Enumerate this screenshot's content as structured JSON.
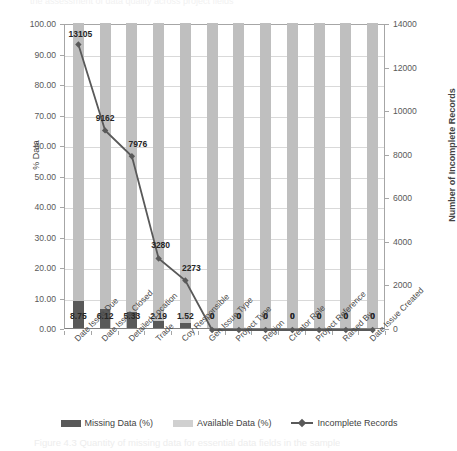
{
  "artifacts": {
    "top_partial_text": "the assessment of data quality across project fields",
    "bottom_caption_partial": "Figure 4.3  Quantity of missing data for essential data fields in the sample"
  },
  "chart_data": {
    "type": "bar",
    "title": "",
    "xlabel": "",
    "ylabel": "% Data",
    "y2label": "Number of Incomplete Records",
    "ylim": [
      0,
      100
    ],
    "y2lim": [
      0,
      14000
    ],
    "ytick_step": 10,
    "y2tick_step": 2000,
    "grid": true,
    "legend_position": "bottom",
    "categories": [
      "Date Issue Due",
      "Date Issue Closed",
      "Detailed Location",
      "Trade",
      "Coy Responsible",
      "Gen Issue Type",
      "Project Type",
      "Region",
      "Creator Role",
      "Project Reference",
      "Raised By",
      "Date Issue Created"
    ],
    "yticks": [
      "0.00",
      "10.00",
      "20.00",
      "30.00",
      "40.00",
      "50.00",
      "60.00",
      "70.00",
      "80.00",
      "90.00",
      "100.00"
    ],
    "y2ticks": [
      "0",
      "2000",
      "4000",
      "6000",
      "8000",
      "10000",
      "12000",
      "14000"
    ],
    "series": [
      {
        "name": "Missing Data (%)",
        "type": "bar",
        "axis": "left",
        "color": "#595959",
        "values": [
          8.75,
          6.12,
          5.33,
          2.19,
          1.52,
          0,
          0,
          0,
          0,
          0,
          0,
          0
        ],
        "labels": [
          "8.75",
          "6.12",
          "5.33",
          "2.19",
          "1.52",
          "0",
          "0",
          "0",
          "0",
          "0",
          "0",
          "0"
        ]
      },
      {
        "name": "Available Data (%)",
        "type": "bar",
        "axis": "left",
        "color": "#bfbfbf",
        "values": [
          100,
          100,
          100,
          100,
          100,
          100,
          100,
          100,
          100,
          100,
          100,
          100
        ],
        "labels": [
          "",
          "",
          "",
          "",
          "",
          "",
          "",
          "",
          "",
          "",
          "",
          ""
        ]
      },
      {
        "name": "Incomplete Records",
        "type": "line",
        "axis": "right",
        "color": "#595959",
        "values": [
          13105,
          9162,
          7976,
          3280,
          2273,
          0,
          0,
          0,
          0,
          0,
          0,
          0
        ],
        "labels": [
          "13105",
          "9162",
          "7976",
          "3280",
          "2273",
          "0",
          "0",
          "0",
          "0",
          "0",
          "0",
          "0"
        ]
      }
    ]
  },
  "legend": {
    "items": [
      {
        "label": "Missing Data (%)",
        "marker": "square-dark"
      },
      {
        "label": "Available Data (%)",
        "marker": "square-light"
      },
      {
        "label": "Incomplete Records",
        "marker": "line-diamond"
      }
    ]
  }
}
